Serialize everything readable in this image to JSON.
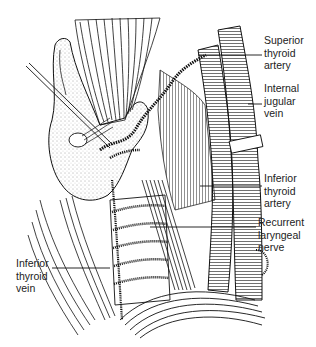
{
  "figure": {
    "labels": [
      {
        "id": "superior-thyroid-artery",
        "text": "Superior\nthyroid\nartery",
        "x": 264,
        "y": 34,
        "leader": [
          [
            198,
            55
          ],
          [
            262,
            55
          ]
        ]
      },
      {
        "id": "internal-jugular-vein",
        "text": "Internal\njugular\nvein",
        "x": 264,
        "y": 82,
        "leader": [
          [
            248,
            104
          ],
          [
            262,
            104
          ]
        ]
      },
      {
        "id": "inferior-thyroid-artery",
        "text": "Inferior\nthyroid\nartery",
        "x": 264,
        "y": 172,
        "leader": [
          [
            200,
            186
          ],
          [
            262,
            186
          ]
        ]
      },
      {
        "id": "recurrent-laryngeal-nerve",
        "text": "Recurrent\nlaryngeal\nnerve",
        "x": 258,
        "y": 216,
        "leader": [
          [
            150,
            227
          ],
          [
            256,
            227
          ]
        ]
      },
      {
        "id": "inferior-thyroid-vein",
        "text": "Inferior\nthyroid\nvein",
        "x": 16,
        "y": 257,
        "leader": [
          [
            52,
            268
          ],
          [
            110,
            268
          ]
        ]
      }
    ]
  }
}
